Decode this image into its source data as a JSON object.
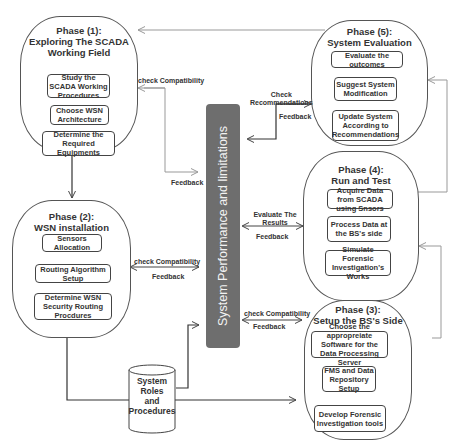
{
  "phases": {
    "phase1": {
      "title_line1": "Phase (1):",
      "title_line2": "Exploring The SCADA",
      "title_line3": "Working Field",
      "steps": [
        "Study the SCADA Working Procedures",
        "Choose WSN Architecture",
        "Determine the Required Equipments"
      ]
    },
    "phase2": {
      "title_line1": "Phase (2):",
      "title_line2": "WSN installation",
      "steps": [
        "Sensors Allocation",
        "Routing Algorithm Setup",
        "Determine WSN Security Routing Procdures"
      ]
    },
    "phase3": {
      "title_line1": "Phase (3):",
      "title_line2": "Setup the BS's Side",
      "steps": [
        "Choose the appropreiate Software for the Data Processing Server",
        "FMS and Data Repository Setup",
        "Develop Forensic Investigation tools"
      ]
    },
    "phase4": {
      "title_line1": "Phase (4):",
      "title_line2": "Run and Test",
      "steps": [
        "Acquire Data from SCADA using Snsors",
        "Process Data at the BS's side",
        "Simulate Forensic Investigation's Works"
      ]
    },
    "phase5": {
      "title_line1": "Phase (5):",
      "title_line2": "System Evaluation",
      "steps": [
        "Evaluate the outcomes",
        "Suggest System Modification",
        "Update System According to Recommendations"
      ]
    }
  },
  "center_bar": {
    "label": "System Performance and limitations",
    "color": "#6e6e6e"
  },
  "database": {
    "line1": "System",
    "line2": "Roles",
    "line3": "and",
    "line4": "Procedures"
  },
  "connectors": {
    "p1_out": "check Compatibility",
    "p1_in": "Feedback",
    "p2_out": "check Compatibility",
    "p2_in": "Feedback",
    "p3_out": "check Compatibility",
    "p3_in": "Feedback",
    "p4_out": "Evaluate The Results",
    "p4_in": "Feedback",
    "p5_out_line1": "Check",
    "p5_out_line2": "Recommendations",
    "p5_in": "Feedback"
  }
}
